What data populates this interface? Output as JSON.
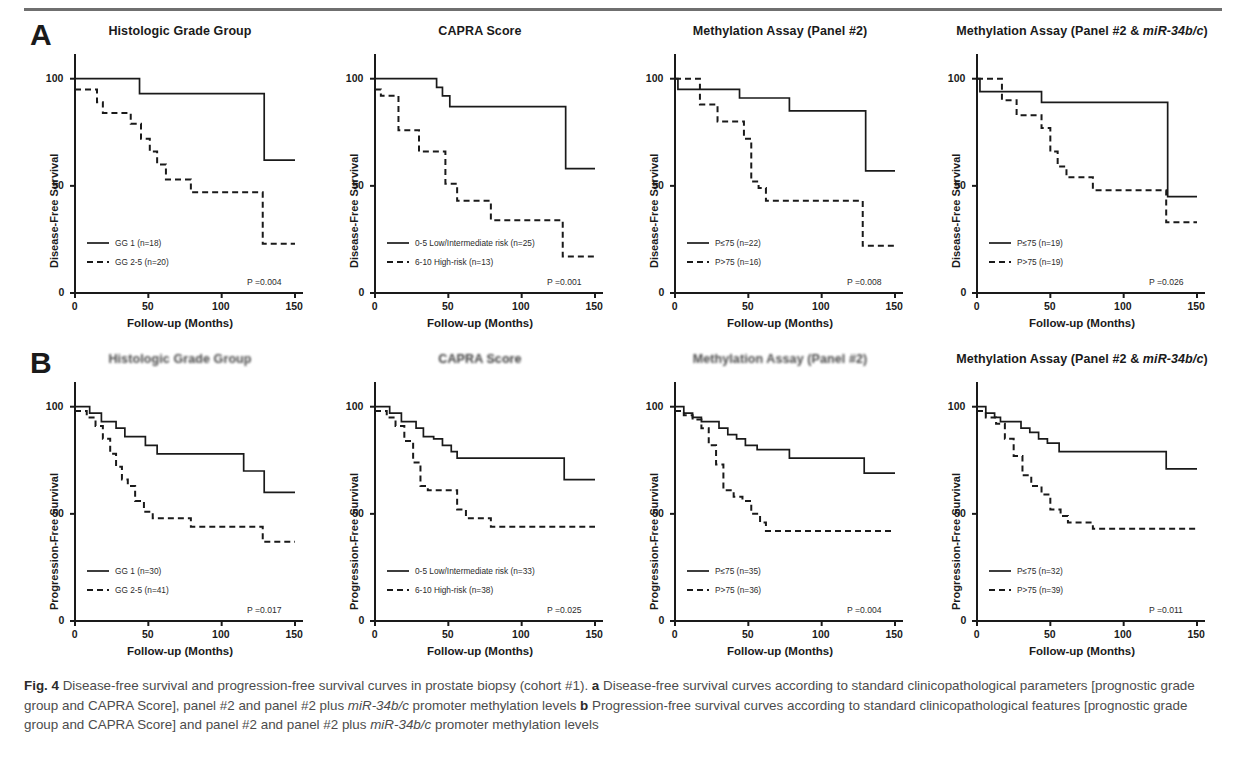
{
  "figure": {
    "caption_label": "Fig. 4",
    "caption_text": " Disease-free survival and progression-free survival curves in prostate biopsy (cohort #1). ",
    "caption_a_marker": "a",
    "caption_a_text": " Disease-free survival curves according to standard clinicopathological parameters [prognostic grade group and CAPRA Score], panel #2 and panel #2 plus ",
    "caption_italic_1": "miR-34b/c",
    "caption_a_tail": " promoter methylation levels ",
    "caption_b_marker": "b",
    "caption_b_text": " Progression-free survival curves according to standard clinicopathological features [prognostic grade group and CAPRA Score] and panel #2 and panel #2 plus ",
    "caption_italic_2": "miR-34b/c",
    "caption_b_tail": " promoter methylation levels"
  },
  "rows": [
    {
      "letter": "A",
      "ylabel": "Disease-Free Survival"
    },
    {
      "letter": "B",
      "ylabel": "Progression-Free Survival"
    }
  ],
  "axes": {
    "xlabel": "Follow-up (Months)",
    "xticks": [
      0,
      50,
      100,
      150
    ],
    "yticks": [
      0,
      50,
      100
    ],
    "xlim": [
      0,
      150
    ],
    "ylim": [
      0,
      105
    ]
  },
  "colors": {
    "line": "#1a1a1a",
    "text": "#1a1a1a",
    "caption": "#4c4c4c",
    "rule": "#6f6f6f"
  },
  "chart_data": [
    {
      "id": "A1",
      "type": "line",
      "row": "A",
      "title": "Histologic Grade Group",
      "title_plain": "Histologic Grade Group",
      "xlabel": "Follow-up (Months)",
      "ylabel": "Disease-Free Survival",
      "xlim": [
        0,
        150
      ],
      "ylim": [
        0,
        105
      ],
      "grid": false,
      "pvalue": "P =0.004",
      "legend_position": "lower-left",
      "series": [
        {
          "name": "GG 1 (n=18)",
          "style": "solid",
          "n": 18,
          "x": [
            0,
            44,
            44,
            129,
            129,
            150
          ],
          "y": [
            100,
            100,
            93,
            93,
            62,
            62
          ]
        },
        {
          "name": "GG 2-5 (n=20)",
          "style": "dashed",
          "n": 20,
          "x": [
            0,
            15,
            15,
            19,
            19,
            30,
            30,
            38,
            38,
            45,
            45,
            51,
            51,
            56,
            56,
            62,
            62,
            70,
            70,
            79,
            79,
            128,
            128,
            150
          ],
          "y": [
            95,
            95,
            89,
            89,
            84,
            84,
            84,
            84,
            79,
            79,
            72,
            72,
            66,
            66,
            60,
            60,
            53,
            53,
            53,
            53,
            47,
            47,
            23,
            23
          ]
        }
      ]
    },
    {
      "id": "A2",
      "type": "line",
      "row": "A",
      "title": "CAPRA Score",
      "title_plain": "CAPRA Score",
      "xlabel": "Follow-up (Months)",
      "ylabel": "Disease-Free Survival",
      "xlim": [
        0,
        150
      ],
      "ylim": [
        0,
        105
      ],
      "grid": false,
      "pvalue": "P =0.001",
      "legend_position": "lower-left",
      "series": [
        {
          "name": "0-5 Low/Intermediate risk (n=25)",
          "style": "solid",
          "n": 25,
          "x": [
            0,
            42,
            42,
            46,
            46,
            51,
            51,
            130,
            130,
            150
          ],
          "y": [
            100,
            100,
            96,
            96,
            92,
            92,
            87,
            87,
            58,
            58
          ]
        },
        {
          "name": "6-10 High-risk (n=13)",
          "style": "dashed",
          "n": 13,
          "x": [
            0,
            4,
            4,
            16,
            16,
            25,
            25,
            30,
            30,
            48,
            48,
            56,
            56,
            62,
            62,
            79,
            79,
            128,
            128,
            150
          ],
          "y": [
            95,
            95,
            92,
            92,
            76,
            76,
            76,
            76,
            66,
            66,
            51,
            51,
            43,
            43,
            43,
            43,
            34,
            34,
            17,
            17
          ]
        }
      ]
    },
    {
      "id": "A3",
      "type": "line",
      "row": "A",
      "title": "Methylation Assay (Panel #2)",
      "title_plain": "Methylation Assay (Panel #2)",
      "xlabel": "Follow-up (Months)",
      "ylabel": "Disease-Free Survival",
      "xlim": [
        0,
        150
      ],
      "ylim": [
        0,
        105
      ],
      "grid": false,
      "pvalue": "P =0.008",
      "legend_position": "lower-left",
      "series": [
        {
          "name": "P≤75 (n=22)",
          "style": "solid",
          "n": 22,
          "x": [
            0,
            2,
            2,
            44,
            44,
            78,
            78,
            130,
            130,
            150
          ],
          "y": [
            100,
            100,
            95,
            95,
            91,
            91,
            85,
            85,
            57,
            57
          ]
        },
        {
          "name": "P>75 (n=16)",
          "style": "dashed",
          "n": 16,
          "x": [
            0,
            17,
            17,
            20,
            20,
            29,
            29,
            33,
            33,
            47,
            47,
            52,
            52,
            57,
            57,
            62,
            62,
            128,
            128,
            150
          ],
          "y": [
            100,
            100,
            88,
            88,
            88,
            88,
            80,
            80,
            80,
            80,
            72,
            72,
            52,
            52,
            49,
            49,
            43,
            43,
            22,
            22
          ]
        }
      ]
    },
    {
      "id": "A4",
      "type": "line",
      "row": "A",
      "title_prefix": "Methylation Assay (Panel #2 & ",
      "title_italic": "miR-34b/c",
      "title_suffix": ")",
      "title_plain": "Methylation Assay (Panel #2 & miR-34b/c)",
      "xlabel": "Follow-up (Months)",
      "ylabel": "Disease-Free Survival",
      "xlim": [
        0,
        150
      ],
      "ylim": [
        0,
        105
      ],
      "grid": false,
      "pvalue": "P =0.026",
      "legend_position": "lower-left",
      "series": [
        {
          "name": "P≤75 (n=19)",
          "style": "solid",
          "n": 19,
          "x": [
            0,
            2,
            2,
            44,
            44,
            130,
            130,
            150
          ],
          "y": [
            100,
            100,
            94,
            94,
            89,
            89,
            45,
            45
          ]
        },
        {
          "name": "P>75 (n=19)",
          "style": "dashed",
          "n": 19,
          "x": [
            0,
            17,
            17,
            20,
            20,
            27,
            27,
            44,
            44,
            50,
            50,
            55,
            55,
            61,
            61,
            79,
            79,
            129,
            129,
            150
          ],
          "y": [
            100,
            100,
            90,
            90,
            90,
            90,
            83,
            83,
            77,
            77,
            66,
            66,
            59,
            59,
            54,
            54,
            48,
            48,
            33,
            33
          ]
        }
      ]
    },
    {
      "id": "B1",
      "type": "line",
      "row": "B",
      "title": "Histologic Grade Group",
      "title_plain": "Histologic Grade Group",
      "degraded": true,
      "xlabel": "Follow-up (Months)",
      "ylabel": "Progression-Free Survival",
      "xlim": [
        0,
        150
      ],
      "ylim": [
        0,
        105
      ],
      "grid": false,
      "pvalue": "P =0.017",
      "legend_position": "lower-left",
      "series": [
        {
          "name": "GG 1 (n=30)",
          "style": "solid",
          "n": 30,
          "x": [
            0,
            10,
            10,
            18,
            18,
            28,
            28,
            34,
            34,
            42,
            42,
            48,
            48,
            56,
            56,
            115,
            115,
            129,
            129,
            150
          ],
          "y": [
            100,
            100,
            97,
            97,
            93,
            93,
            90,
            90,
            86,
            86,
            86,
            86,
            82,
            82,
            78,
            78,
            70,
            70,
            60,
            60
          ]
        },
        {
          "name": "GG 2-5 (n=41)",
          "style": "dashed",
          "n": 41,
          "x": [
            0,
            8,
            8,
            14,
            14,
            19,
            19,
            24,
            24,
            28,
            28,
            32,
            32,
            36,
            36,
            41,
            41,
            47,
            47,
            53,
            53,
            60,
            60,
            79,
            79,
            128,
            128,
            150
          ],
          "y": [
            98,
            98,
            95,
            95,
            91,
            91,
            85,
            85,
            78,
            78,
            72,
            72,
            66,
            66,
            63,
            63,
            56,
            56,
            51,
            51,
            48,
            48,
            48,
            48,
            44,
            44,
            37,
            37
          ]
        }
      ]
    },
    {
      "id": "B2",
      "type": "line",
      "row": "B",
      "title": "CAPRA Score",
      "title_plain": "CAPRA Score",
      "degraded": true,
      "xlabel": "Follow-up (Months)",
      "ylabel": "Progression-Free Survival",
      "xlim": [
        0,
        150
      ],
      "ylim": [
        0,
        105
      ],
      "grid": false,
      "pvalue": "P =0.025",
      "legend_position": "lower-left",
      "series": [
        {
          "name": "0-5 Low/Intermediate risk (n=33)",
          "style": "solid",
          "n": 33,
          "x": [
            0,
            10,
            10,
            18,
            18,
            28,
            28,
            33,
            33,
            40,
            40,
            46,
            46,
            52,
            52,
            56,
            56,
            115,
            115,
            129,
            129,
            150
          ],
          "y": [
            100,
            100,
            97,
            97,
            93,
            93,
            90,
            90,
            86,
            86,
            85,
            85,
            82,
            82,
            79,
            79,
            76,
            76,
            76,
            76,
            66,
            66
          ]
        },
        {
          "name": "6-10 High-risk (n=38)",
          "style": "dashed",
          "n": 38,
          "x": [
            0,
            8,
            8,
            14,
            14,
            20,
            20,
            26,
            26,
            31,
            31,
            36,
            36,
            50,
            50,
            56,
            56,
            62,
            62,
            79,
            79,
            128,
            128,
            150
          ],
          "y": [
            98,
            98,
            95,
            95,
            91,
            91,
            84,
            84,
            74,
            74,
            63,
            63,
            61,
            61,
            61,
            61,
            52,
            52,
            48,
            48,
            44,
            44,
            44,
            44
          ]
        }
      ]
    },
    {
      "id": "B3",
      "type": "line",
      "row": "B",
      "title": "Methylation Assay (Panel #2)",
      "title_plain": "Methylation Assay (Panel #2)",
      "degraded": true,
      "xlabel": "Follow-up (Months)",
      "ylabel": "Progression-Free Survival",
      "xlim": [
        0,
        150
      ],
      "ylim": [
        0,
        105
      ],
      "grid": false,
      "pvalue": "P =0.004",
      "legend_position": "lower-left",
      "series": [
        {
          "name": "P≤75 (n=35)",
          "style": "solid",
          "n": 35,
          "x": [
            0,
            6,
            6,
            12,
            12,
            18,
            18,
            30,
            30,
            36,
            36,
            42,
            42,
            48,
            48,
            56,
            56,
            78,
            78,
            115,
            115,
            129,
            129,
            150
          ],
          "y": [
            100,
            100,
            97,
            97,
            95,
            95,
            93,
            93,
            90,
            90,
            87,
            87,
            85,
            85,
            82,
            82,
            80,
            80,
            76,
            76,
            76,
            76,
            69,
            69
          ]
        },
        {
          "name": "P>75 (n=36)",
          "style": "dashed",
          "n": 36,
          "x": [
            0,
            6,
            6,
            12,
            12,
            18,
            18,
            23,
            23,
            28,
            28,
            33,
            33,
            40,
            40,
            46,
            46,
            52,
            52,
            58,
            58,
            62,
            62,
            128,
            128,
            150
          ],
          "y": [
            98,
            98,
            96,
            96,
            94,
            94,
            90,
            90,
            82,
            82,
            73,
            73,
            61,
            61,
            58,
            58,
            56,
            56,
            50,
            50,
            46,
            46,
            42,
            42,
            42,
            42
          ]
        }
      ]
    },
    {
      "id": "B4",
      "type": "line",
      "row": "B",
      "title_prefix": "Methylation Assay (Panel #2 & ",
      "title_italic": "miR-34b/c",
      "title_suffix": ")",
      "title_plain": "Methylation Assay (Panel #2 & miR-34b/c)",
      "xlabel": "Follow-up (Months)",
      "ylabel": "Progression-Free Survival",
      "xlim": [
        0,
        150
      ],
      "ylim": [
        0,
        105
      ],
      "grid": false,
      "pvalue": "P =0.011",
      "legend_position": "lower-left",
      "series": [
        {
          "name": "P≤75 (n=32)",
          "style": "solid",
          "n": 32,
          "x": [
            0,
            6,
            6,
            12,
            12,
            16,
            16,
            30,
            30,
            36,
            36,
            42,
            42,
            48,
            48,
            56,
            56,
            115,
            115,
            129,
            129,
            150
          ],
          "y": [
            100,
            100,
            97,
            97,
            95,
            95,
            93,
            93,
            90,
            90,
            88,
            88,
            85,
            85,
            83,
            83,
            79,
            79,
            79,
            79,
            71,
            71
          ]
        },
        {
          "name": "P>75 (n=39)",
          "style": "dashed",
          "n": 39,
          "x": [
            0,
            6,
            6,
            13,
            13,
            19,
            19,
            25,
            25,
            31,
            31,
            37,
            37,
            44,
            44,
            50,
            50,
            57,
            57,
            62,
            62,
            79,
            79,
            128,
            128,
            150
          ],
          "y": [
            98,
            98,
            95,
            95,
            92,
            92,
            85,
            85,
            77,
            77,
            68,
            68,
            63,
            63,
            59,
            59,
            52,
            52,
            49,
            49,
            46,
            46,
            43,
            43,
            43,
            43
          ]
        }
      ]
    }
  ]
}
